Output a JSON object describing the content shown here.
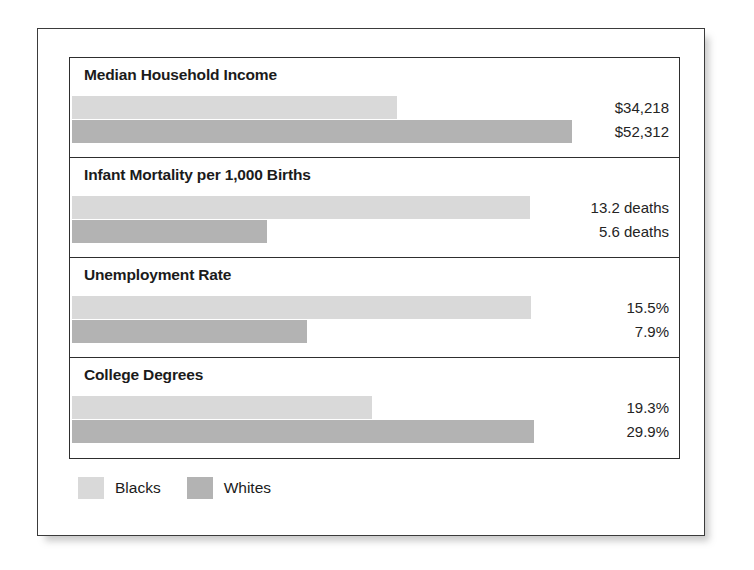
{
  "chart_data": {
    "type": "bar",
    "title": "",
    "orientation": "horizontal",
    "xlabel": "",
    "ylabel": "",
    "grid": false,
    "legend_position": "bottom-left",
    "categories": [
      "Median Household Income",
      "Infant Mortality per 1,000 Births",
      "Unemployment Rate",
      "College Degrees"
    ],
    "series": [
      {
        "name": "Blacks",
        "color": "#d9d9d9",
        "values": [
          34218,
          13.2,
          15.5,
          19.3
        ],
        "value_labels": [
          "$34,218",
          "13.2 deaths",
          "15.5%",
          "19.3%"
        ],
        "bar_px": [
          325,
          458,
          459,
          300
        ]
      },
      {
        "name": "Whites",
        "color": "#b3b3b3",
        "values": [
          52312,
          5.6,
          7.9,
          29.9
        ],
        "value_labels": [
          "$52,312",
          "5.6 deaths",
          "7.9%",
          "29.9%"
        ],
        "bar_px": [
          500,
          195,
          235,
          462
        ]
      }
    ],
    "sections": [
      {
        "title": "Median Household Income",
        "blacks_label": "$34,218",
        "whites_label": "$52,312",
        "blacks_px": "325px",
        "whites_px": "500px"
      },
      {
        "title": "Infant Mortality per 1,000 Births",
        "blacks_label": "13.2 deaths",
        "whites_label": "5.6 deaths",
        "blacks_px": "458px",
        "whites_px": "195px"
      },
      {
        "title": "Unemployment Rate",
        "blacks_label": "15.5%",
        "whites_label": "7.9%",
        "blacks_px": "459px",
        "whites_px": "235px"
      },
      {
        "title": "College Degrees",
        "blacks_label": "19.3%",
        "whites_label": "29.9%",
        "blacks_px": "300px",
        "whites_px": "462px"
      }
    ]
  },
  "legend": {
    "items": [
      {
        "label": "Blacks",
        "color": "#d9d9d9"
      },
      {
        "label": "Whites",
        "color": "#b3b3b3"
      }
    ]
  }
}
